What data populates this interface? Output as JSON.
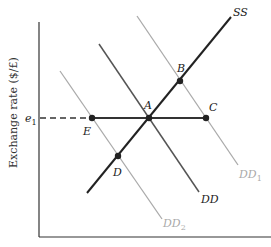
{
  "diagram": {
    "y_axis_label": "Exchange rate ($/£)",
    "e1_label": "e",
    "e1_sub": "1",
    "curves": {
      "ss": {
        "label": "SS",
        "color": "#222222"
      },
      "dd": {
        "label": "DD",
        "color": "#555555"
      },
      "dd1": {
        "label": "DD",
        "sub": "1",
        "color": "#aaaaaa"
      },
      "dd2": {
        "label": "DD",
        "sub": "2",
        "color": "#aaaaaa"
      }
    },
    "points": {
      "a": "A",
      "b": "B",
      "c": "C",
      "d": "D",
      "e": "E"
    }
  }
}
